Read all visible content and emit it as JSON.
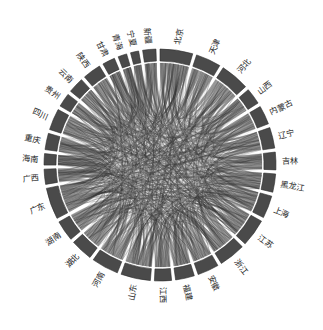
{
  "figure": {
    "type": "chord-diagram",
    "width": 323,
    "height": 330,
    "background_color": "#ffffff",
    "center_x": 160,
    "center_y": 165,
    "outer_radius": 116,
    "arc_inner_radius": 104,
    "label_radius": 122
  },
  "style": {
    "arc_fill": "#4a4a4a",
    "arc_stroke": "#2b2b2b",
    "chord_color": "#3a3a3a",
    "chord_light": "#8c8c8c",
    "label_color": "#1c1c1c",
    "gap_color": "#ffffff"
  },
  "chart_data": {
    "type": "chord",
    "title": "",
    "subtitle": "",
    "xlabel": "",
    "ylabel": "",
    "grid": false,
    "legend": "none",
    "start_angle_deg": -90,
    "direction": "clockwise",
    "nodes": [
      {
        "label": "北京",
        "pinyin": "Beijing",
        "value": 52,
        "label_orientation": "radial"
      },
      {
        "label": "天津",
        "pinyin": "Tianjin",
        "value": 40,
        "label_orientation": "radial"
      },
      {
        "label": "河北",
        "pinyin": "Hebei",
        "value": 46,
        "label_orientation": "radial"
      },
      {
        "label": "山西",
        "pinyin": "Shanxi",
        "value": 26,
        "label_orientation": "radial"
      },
      {
        "label": "内蒙古",
        "pinyin": "Nei Menggu",
        "value": 30,
        "label_orientation": "radial"
      },
      {
        "label": "辽宁",
        "pinyin": "Liaoning",
        "value": 33,
        "label_orientation": "radial"
      },
      {
        "label": "吉林",
        "pinyin": "Jilin",
        "value": 28,
        "label_orientation": "radial"
      },
      {
        "label": "黑龙江",
        "pinyin": "Heilongjiang",
        "value": 29,
        "label_orientation": "radial"
      },
      {
        "label": "上海",
        "pinyin": "Shanghai",
        "value": 36,
        "label_orientation": "radial"
      },
      {
        "label": "江苏",
        "pinyin": "Jiangsu",
        "value": 44,
        "label_orientation": "radial"
      },
      {
        "label": "浙江",
        "pinyin": "Zhejiang",
        "value": 42,
        "label_orientation": "radial"
      },
      {
        "label": "安徽",
        "pinyin": "Anhui",
        "value": 34,
        "label_orientation": "radial"
      },
      {
        "label": "福建",
        "pinyin": "Fujian",
        "value": 30,
        "label_orientation": "radial"
      },
      {
        "label": "江西",
        "pinyin": "Jiangxi",
        "value": 27,
        "label_orientation": "radial"
      },
      {
        "label": "山东",
        "pinyin": "Shandong",
        "value": 47,
        "label_orientation": "radial"
      },
      {
        "label": "河南",
        "pinyin": "Henan",
        "value": 43,
        "label_orientation": "radial"
      },
      {
        "label": "湖北",
        "pinyin": "Hubei",
        "value": 35,
        "label_orientation": "horizontal"
      },
      {
        "label": "湖南",
        "pinyin": "Hunan",
        "value": 33,
        "label_orientation": "horizontal"
      },
      {
        "label": "广东",
        "pinyin": "Guangdong",
        "value": 50,
        "label_orientation": "horizontal"
      },
      {
        "label": "广西",
        "pinyin": "Guangxi",
        "value": 24,
        "label_orientation": "horizontal"
      },
      {
        "label": "海南",
        "pinyin": "Hainan",
        "value": 18,
        "label_orientation": "horizontal"
      },
      {
        "label": "重庆",
        "pinyin": "Chongqing",
        "value": 26,
        "label_orientation": "horizontal"
      },
      {
        "label": "四川",
        "pinyin": "Sichuan",
        "value": 34,
        "label_orientation": "radial"
      },
      {
        "label": "贵州",
        "pinyin": "Guizhou",
        "value": 22,
        "label_orientation": "radial"
      },
      {
        "label": "云南",
        "pinyin": "Yunnan",
        "value": 25,
        "label_orientation": "radial"
      },
      {
        "label": "陕西",
        "pinyin": "Shaanxi",
        "value": 29,
        "label_orientation": "radial"
      },
      {
        "label": "甘肃",
        "pinyin": "Gansu",
        "value": 20,
        "label_orientation": "radial"
      },
      {
        "label": "青海",
        "pinyin": "Qinghai",
        "value": 14,
        "label_orientation": "radial"
      },
      {
        "label": "宁夏",
        "pinyin": "Ningxia",
        "value": 13,
        "label_orientation": "radial"
      },
      {
        "label": "新疆",
        "pinyin": "Xinjiang",
        "value": 21,
        "label_orientation": "radial"
      },
      {
        "label": "天津市",
        "pinyin": "placeholder",
        "value": 0,
        "label_orientation": "radial",
        "hidden": true
      }
    ],
    "flows": [
      {
        "source": 0,
        "target": 9,
        "value": 9
      },
      {
        "source": 0,
        "target": 10,
        "value": 8
      },
      {
        "source": 0,
        "target": 14,
        "value": 7
      },
      {
        "source": 0,
        "target": 18,
        "value": 9
      },
      {
        "source": 0,
        "target": 8,
        "value": 8
      },
      {
        "source": 0,
        "target": 15,
        "value": 6
      },
      {
        "source": 0,
        "target": 2,
        "value": 7
      },
      {
        "source": 0,
        "target": 5,
        "value": 5
      },
      {
        "source": 1,
        "target": 9,
        "value": 6
      },
      {
        "source": 1,
        "target": 14,
        "value": 6
      },
      {
        "source": 1,
        "target": 18,
        "value": 7
      },
      {
        "source": 1,
        "target": 8,
        "value": 6
      },
      {
        "source": 1,
        "target": 2,
        "value": 5
      },
      {
        "source": 2,
        "target": 14,
        "value": 7
      },
      {
        "source": 2,
        "target": 15,
        "value": 6
      },
      {
        "source": 2,
        "target": 18,
        "value": 6
      },
      {
        "source": 3,
        "target": 15,
        "value": 5
      },
      {
        "source": 3,
        "target": 14,
        "value": 4
      },
      {
        "source": 4,
        "target": 5,
        "value": 4
      },
      {
        "source": 4,
        "target": 14,
        "value": 4
      },
      {
        "source": 5,
        "target": 6,
        "value": 5
      },
      {
        "source": 5,
        "target": 7,
        "value": 5
      },
      {
        "source": 5,
        "target": 18,
        "value": 6
      },
      {
        "source": 6,
        "target": 7,
        "value": 5
      },
      {
        "source": 6,
        "target": 18,
        "value": 4
      },
      {
        "source": 7,
        "target": 18,
        "value": 5
      },
      {
        "source": 8,
        "target": 9,
        "value": 9
      },
      {
        "source": 8,
        "target": 10,
        "value": 8
      },
      {
        "source": 8,
        "target": 11,
        "value": 6
      },
      {
        "source": 8,
        "target": 18,
        "value": 7
      },
      {
        "source": 9,
        "target": 10,
        "value": 9
      },
      {
        "source": 9,
        "target": 11,
        "value": 7
      },
      {
        "source": 9,
        "target": 14,
        "value": 7
      },
      {
        "source": 9,
        "target": 18,
        "value": 8
      },
      {
        "source": 10,
        "target": 11,
        "value": 6
      },
      {
        "source": 10,
        "target": 12,
        "value": 6
      },
      {
        "source": 10,
        "target": 13,
        "value": 5
      },
      {
        "source": 10,
        "target": 18,
        "value": 8
      },
      {
        "source": 11,
        "target": 13,
        "value": 5
      },
      {
        "source": 11,
        "target": 15,
        "value": 5
      },
      {
        "source": 12,
        "target": 13,
        "value": 5
      },
      {
        "source": 12,
        "target": 18,
        "value": 6
      },
      {
        "source": 13,
        "target": 17,
        "value": 5
      },
      {
        "source": 13,
        "target": 18,
        "value": 5
      },
      {
        "source": 14,
        "target": 15,
        "value": 7
      },
      {
        "source": 14,
        "target": 18,
        "value": 7
      },
      {
        "source": 15,
        "target": 16,
        "value": 6
      },
      {
        "source": 15,
        "target": 18,
        "value": 7
      },
      {
        "source": 16,
        "target": 17,
        "value": 6
      },
      {
        "source": 16,
        "target": 18,
        "value": 7
      },
      {
        "source": 17,
        "target": 18,
        "value": 7
      },
      {
        "source": 18,
        "target": 19,
        "value": 6
      },
      {
        "source": 18,
        "target": 20,
        "value": 5
      },
      {
        "source": 18,
        "target": 21,
        "value": 5
      },
      {
        "source": 18,
        "target": 22,
        "value": 6
      },
      {
        "source": 18,
        "target": 25,
        "value": 5
      },
      {
        "source": 19,
        "target": 22,
        "value": 4
      },
      {
        "source": 20,
        "target": 18,
        "value": 4
      },
      {
        "source": 21,
        "target": 22,
        "value": 5
      },
      {
        "source": 22,
        "target": 23,
        "value": 4
      },
      {
        "source": 22,
        "target": 24,
        "value": 4
      },
      {
        "source": 22,
        "target": 25,
        "value": 5
      },
      {
        "source": 23,
        "target": 24,
        "value": 4
      },
      {
        "source": 24,
        "target": 18,
        "value": 4
      },
      {
        "source": 25,
        "target": 26,
        "value": 4
      },
      {
        "source": 25,
        "target": 15,
        "value": 5
      },
      {
        "source": 26,
        "target": 27,
        "value": 3
      },
      {
        "source": 26,
        "target": 28,
        "value": 3
      },
      {
        "source": 27,
        "target": 29,
        "value": 3
      },
      {
        "source": 28,
        "target": 29,
        "value": 3
      },
      {
        "source": 29,
        "target": 0,
        "value": 4
      },
      {
        "source": 29,
        "target": 18,
        "value": 4
      },
      {
        "source": 27,
        "target": 0,
        "value": 3
      },
      {
        "source": 28,
        "target": 0,
        "value": 3
      },
      {
        "source": 23,
        "target": 18,
        "value": 4
      },
      {
        "source": 21,
        "target": 18,
        "value": 4
      },
      {
        "source": 3,
        "target": 0,
        "value": 4
      },
      {
        "source": 4,
        "target": 0,
        "value": 4
      },
      {
        "source": 6,
        "target": 0,
        "value": 4
      },
      {
        "source": 7,
        "target": 0,
        "value": 4
      },
      {
        "source": 11,
        "target": 0,
        "value": 5
      },
      {
        "source": 12,
        "target": 0,
        "value": 5
      },
      {
        "source": 13,
        "target": 0,
        "value": 4
      },
      {
        "source": 16,
        "target": 0,
        "value": 5
      },
      {
        "source": 17,
        "target": 0,
        "value": 5
      },
      {
        "source": 19,
        "target": 0,
        "value": 4
      },
      {
        "source": 20,
        "target": 0,
        "value": 3
      },
      {
        "source": 22,
        "target": 0,
        "value": 5
      },
      {
        "source": 24,
        "target": 0,
        "value": 4
      },
      {
        "source": 26,
        "target": 0,
        "value": 3
      },
      {
        "source": 3,
        "target": 9,
        "value": 4
      },
      {
        "source": 4,
        "target": 9,
        "value": 4
      },
      {
        "source": 5,
        "target": 9,
        "value": 5
      },
      {
        "source": 6,
        "target": 9,
        "value": 4
      },
      {
        "source": 7,
        "target": 9,
        "value": 4
      },
      {
        "source": 12,
        "target": 9,
        "value": 5
      },
      {
        "source": 13,
        "target": 9,
        "value": 5
      },
      {
        "source": 16,
        "target": 9,
        "value": 5
      },
      {
        "source": 17,
        "target": 9,
        "value": 5
      },
      {
        "source": 19,
        "target": 9,
        "value": 4
      },
      {
        "source": 21,
        "target": 9,
        "value": 4
      },
      {
        "source": 23,
        "target": 9,
        "value": 3
      },
      {
        "source": 25,
        "target": 9,
        "value": 4
      },
      {
        "source": 26,
        "target": 9,
        "value": 3
      },
      {
        "source": 27,
        "target": 9,
        "value": 2
      },
      {
        "source": 28,
        "target": 9,
        "value": 2
      },
      {
        "source": 29,
        "target": 9,
        "value": 3
      },
      {
        "source": 2,
        "target": 9,
        "value": 6
      },
      {
        "source": 2,
        "target": 10,
        "value": 5
      },
      {
        "source": 3,
        "target": 10,
        "value": 4
      },
      {
        "source": 4,
        "target": 10,
        "value": 3
      },
      {
        "source": 5,
        "target": 10,
        "value": 5
      },
      {
        "source": 14,
        "target": 10,
        "value": 6
      },
      {
        "source": 15,
        "target": 10,
        "value": 6
      },
      {
        "source": 16,
        "target": 10,
        "value": 5
      },
      {
        "source": 17,
        "target": 10,
        "value": 5
      },
      {
        "source": 22,
        "target": 10,
        "value": 4
      },
      {
        "source": 24,
        "target": 10,
        "value": 3
      },
      {
        "source": 2,
        "target": 18,
        "value": 6
      },
      {
        "source": 3,
        "target": 18,
        "value": 4
      },
      {
        "source": 4,
        "target": 18,
        "value": 4
      },
      {
        "source": 11,
        "target": 18,
        "value": 5
      },
      {
        "source": 14,
        "target": 8,
        "value": 6
      },
      {
        "source": 15,
        "target": 8,
        "value": 5
      },
      {
        "source": 16,
        "target": 8,
        "value": 5
      },
      {
        "source": 17,
        "target": 8,
        "value": 5
      },
      {
        "source": 22,
        "target": 8,
        "value": 4
      },
      {
        "source": 2,
        "target": 8,
        "value": 5
      },
      {
        "source": 5,
        "target": 8,
        "value": 4
      },
      {
        "source": 12,
        "target": 8,
        "value": 4
      },
      {
        "source": 13,
        "target": 8,
        "value": 4
      },
      {
        "source": 19,
        "target": 10,
        "value": 3
      },
      {
        "source": 20,
        "target": 10,
        "value": 2
      },
      {
        "source": 21,
        "target": 14,
        "value": 3
      },
      {
        "source": 23,
        "target": 14,
        "value": 3
      },
      {
        "source": 25,
        "target": 14,
        "value": 4
      },
      {
        "source": 29,
        "target": 14,
        "value": 3
      },
      {
        "source": 27,
        "target": 14,
        "value": 2
      },
      {
        "source": 28,
        "target": 15,
        "value": 2
      },
      {
        "source": 26,
        "target": 15,
        "value": 3
      },
      {
        "source": 24,
        "target": 15,
        "value": 3
      },
      {
        "source": 20,
        "target": 15,
        "value": 2
      },
      {
        "source": 19,
        "target": 15,
        "value": 3
      },
      {
        "source": 16,
        "target": 14,
        "value": 5
      },
      {
        "source": 17,
        "target": 14,
        "value": 5
      },
      {
        "source": 11,
        "target": 14,
        "value": 5
      },
      {
        "source": 12,
        "target": 14,
        "value": 4
      },
      {
        "source": 13,
        "target": 14,
        "value": 4
      },
      {
        "source": 6,
        "target": 14,
        "value": 4
      },
      {
        "source": 7,
        "target": 14,
        "value": 4
      },
      {
        "source": 22,
        "target": 14,
        "value": 4
      },
      {
        "source": 22,
        "target": 9,
        "value": 5
      },
      {
        "source": 24,
        "target": 9,
        "value": 3
      },
      {
        "source": 1,
        "target": 10,
        "value": 5
      },
      {
        "source": 1,
        "target": 15,
        "value": 4
      },
      {
        "source": 1,
        "target": 0,
        "value": 6
      }
    ]
  }
}
